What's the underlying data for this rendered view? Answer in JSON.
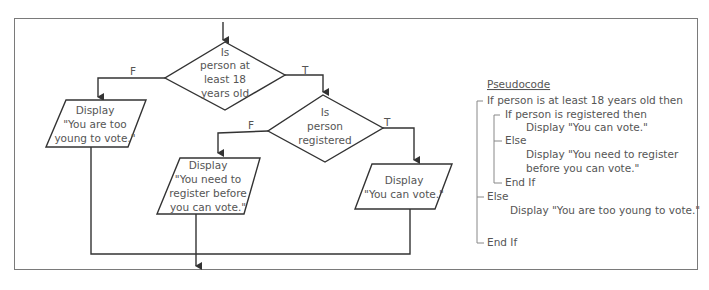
{
  "flowchart": {
    "decision1": {
      "lines": [
        "Is",
        "person at",
        "least 18",
        "years old"
      ]
    },
    "decision2": {
      "lines": [
        "Is",
        "person",
        "registered"
      ]
    },
    "branch_labels": {
      "false": "F",
      "true": "T"
    },
    "output_too_young": {
      "lines": [
        "Display",
        "\"You are too",
        "young to vote.\""
      ]
    },
    "output_register": {
      "lines": [
        "Display",
        "\"You need to",
        "register before",
        "you can vote.\""
      ]
    },
    "output_can_vote": {
      "lines": [
        "Display",
        "\"You can vote.\""
      ]
    }
  },
  "pseudocode": {
    "title": "Pseudocode",
    "lines": [
      "If person is at least 18 years old then",
      "If person is registered then",
      "Display \"You can vote.\"",
      "Else",
      "Display \"You need to register",
      "before you can vote.\"",
      "End If",
      "Else",
      "Display \"You are too young to vote.\"",
      "End If"
    ]
  },
  "colors": {
    "line": "#333333",
    "text": "#555555",
    "frame": "#7a7a7a"
  }
}
